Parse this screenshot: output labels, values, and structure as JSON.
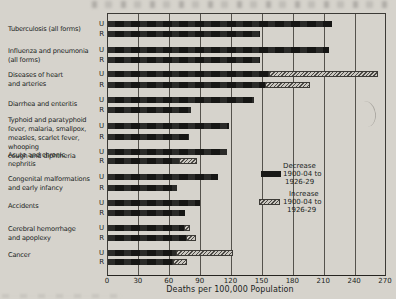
{
  "chart_data": {
    "type": "bar",
    "orientation": "horizontal",
    "title": "",
    "xlabel": "Deaths per 100,000 Population",
    "xlim": [
      0,
      270
    ],
    "xticks": [
      0,
      30,
      60,
      90,
      120,
      150,
      180,
      210,
      240,
      270
    ],
    "grid": true,
    "row_labels": [
      "U",
      "R"
    ],
    "legend": {
      "position": "middle-right",
      "items": [
        {
          "style": "solid",
          "lines": [
            "Decrease",
            "1900-04 to",
            "1926-29"
          ]
        },
        {
          "style": "hatched",
          "lines": [
            "Increase",
            "1900-04 to",
            "1926-29"
          ]
        }
      ]
    },
    "colors": {
      "background": "#d6d3cc",
      "bar_solid": "#191917",
      "bar_hatch_base": "#c9c6bf",
      "grid": "#55524c",
      "text": "#201e1c"
    },
    "groups": [
      {
        "label_lines": [
          "Tuberculosis (all forms)"
        ],
        "rows": [
          {
            "loc": "U",
            "solid": 218,
            "total": 218
          },
          {
            "loc": "R",
            "solid": 148,
            "total": 148
          }
        ]
      },
      {
        "label_lines": [
          "Influenza and pneumonia",
          "(all forms)"
        ],
        "rows": [
          {
            "loc": "U",
            "solid": 215,
            "total": 215
          },
          {
            "loc": "R",
            "solid": 148,
            "total": 148
          }
        ]
      },
      {
        "label_lines": [
          "Diseases of heart",
          "and arteries"
        ],
        "rows": [
          {
            "loc": "U",
            "solid": 157,
            "total": 262
          },
          {
            "loc": "R",
            "solid": 153,
            "total": 196
          }
        ]
      },
      {
        "label_lines": [
          "Diarrhea and enteritis"
        ],
        "rows": [
          {
            "loc": "U",
            "solid": 142,
            "total": 142
          },
          {
            "loc": "R",
            "solid": 81,
            "total": 81
          }
        ]
      },
      {
        "label_lines": [
          "Typhoid and paratyphoid",
          "fever, malaria, smallpox,",
          "measles, scarlet fever, whooping",
          "cough and diphtheria"
        ],
        "rows": [
          {
            "loc": "U",
            "solid": 118,
            "total": 118
          },
          {
            "loc": "R",
            "solid": 79,
            "total": 79
          }
        ]
      },
      {
        "label_lines": [
          "Acute and chronic",
          "nephritis"
        ],
        "rows": [
          {
            "loc": "U",
            "solid": 116,
            "total": 116
          },
          {
            "loc": "R",
            "solid": 70,
            "total": 86
          }
        ]
      },
      {
        "label_lines": [
          "Congenital malformations",
          "and early infancy"
        ],
        "rows": [
          {
            "loc": "U",
            "solid": 107,
            "total": 107
          },
          {
            "loc": "R",
            "solid": 67,
            "total": 67
          }
        ]
      },
      {
        "label_lines": [
          "Accidents"
        ],
        "rows": [
          {
            "loc": "U",
            "solid": 89,
            "total": 89
          },
          {
            "loc": "R",
            "solid": 75,
            "total": 75
          }
        ]
      },
      {
        "label_lines": [
          "Cerebral hemorrhage",
          "and apoplexy"
        ],
        "rows": [
          {
            "loc": "U",
            "solid": 75,
            "total": 80
          },
          {
            "loc": "R",
            "solid": 77,
            "total": 85
          }
        ]
      },
      {
        "label_lines": [
          "Cancer"
        ],
        "rows": [
          {
            "loc": "U",
            "solid": 67,
            "total": 121
          },
          {
            "loc": "R",
            "solid": 64,
            "total": 77
          }
        ]
      }
    ]
  }
}
